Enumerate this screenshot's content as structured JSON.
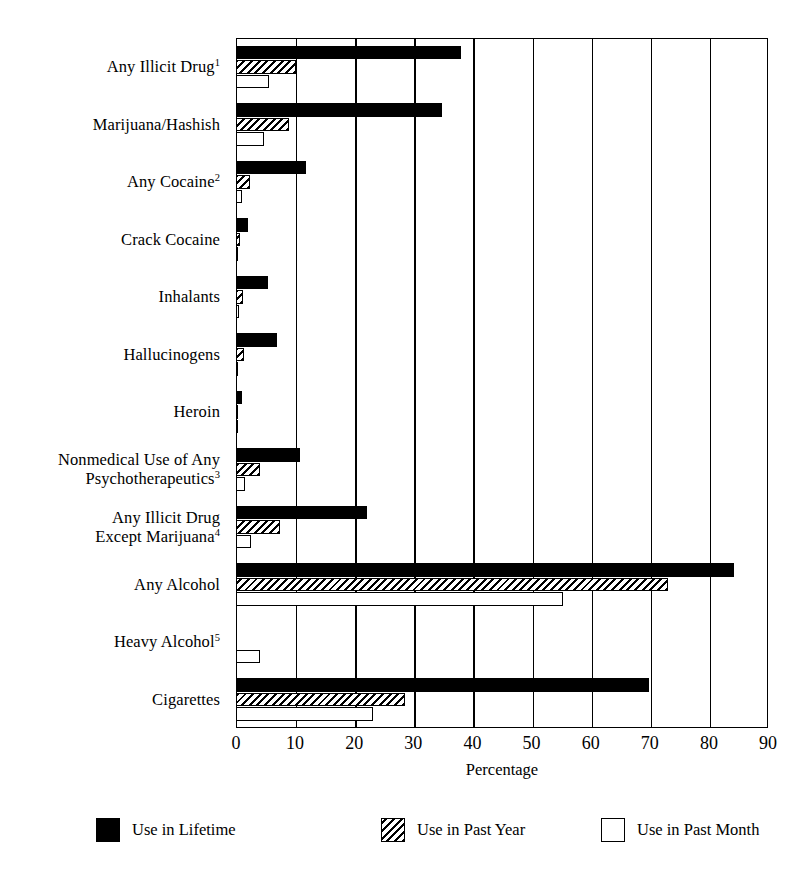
{
  "chart_data": {
    "type": "bar",
    "orientation": "horizontal",
    "title": "",
    "xlabel": "Percentage",
    "ylabel": "",
    "xlim": [
      0,
      90
    ],
    "xticks": [
      0,
      10,
      20,
      30,
      40,
      50,
      60,
      70,
      80,
      90
    ],
    "grid": true,
    "grid_axis": "x",
    "legend_position": "bottom",
    "categories": [
      "Any Illicit Drug",
      "Marijuana/Hashish",
      "Any Cocaine",
      "Crack Cocaine",
      "Inhalants",
      "Hallucinogens",
      "Heroin",
      "Nonmedical Use of Any Psychotherapeutics",
      "Any Illicit Drug Except Marijuana",
      "Any Alcohol",
      "Heavy Alcohol",
      "Cigarettes"
    ],
    "category_footnotes": [
      "1",
      "",
      "2",
      "",
      "",
      "",
      "",
      "3",
      "4",
      "",
      "5",
      ""
    ],
    "category_display": [
      "Any Illicit Drug",
      "Marijuana/Hashish",
      "Any Cocaine",
      "Crack Cocaine",
      "Inhalants",
      "Hallucinogens",
      "Heroin",
      "Nonmedical Use of Any\nPsychotherapeutics",
      "Any Illicit Drug\nExcept Marijuana",
      "Any Alcohol",
      "Heavy Alcohol",
      "Cigarettes"
    ],
    "series": [
      {
        "name": "Use in Lifetime",
        "pattern": "solid-black",
        "values": [
          38.0,
          34.8,
          11.8,
          2.0,
          5.4,
          6.9,
          1.0,
          10.9,
          22.2,
          84.2,
          null,
          69.8
        ]
      },
      {
        "name": "Use in Past Year",
        "pattern": "diagonal-hatch",
        "values": [
          10.1,
          9.0,
          2.4,
          0.6,
          1.1,
          1.3,
          0.2,
          4.1,
          7.4,
          73.0,
          null,
          28.6
        ]
      },
      {
        "name": "Use in Past Month",
        "pattern": "open-white",
        "values": [
          5.6,
          4.7,
          1.0,
          0.4,
          0.5,
          0.4,
          0.1,
          1.6,
          2.6,
          55.3,
          4.1,
          23.1
        ]
      }
    ]
  },
  "legend": {
    "items": [
      {
        "label": "Use in Lifetime",
        "swatch": "solid-black-swatch"
      },
      {
        "label": "Use in Past Year",
        "swatch": "hatched-swatch"
      },
      {
        "label": "Use in Past Month",
        "swatch": "open-white-swatch"
      }
    ]
  },
  "axis": {
    "x_title": "Percentage"
  }
}
